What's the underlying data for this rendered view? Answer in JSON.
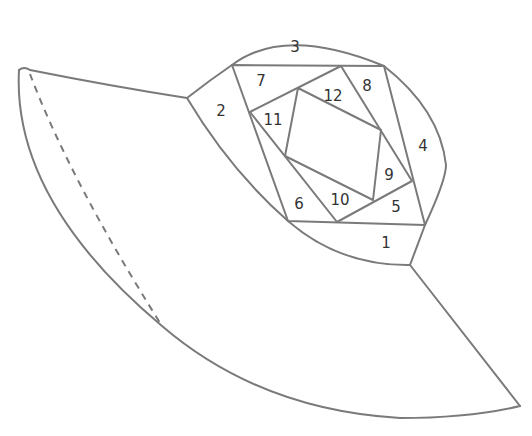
{
  "diagram": {
    "line_color": "#7a7a7a",
    "label_color": "#333333",
    "background": "#ffffff",
    "section_labels": [
      {
        "id": "1",
        "text": "1",
        "x": 386,
        "y": 243
      },
      {
        "id": "2",
        "text": "2",
        "x": 221,
        "y": 111
      },
      {
        "id": "3",
        "text": "3",
        "x": 295,
        "y": 47
      },
      {
        "id": "4",
        "text": "4",
        "x": 423,
        "y": 146
      },
      {
        "id": "5",
        "text": "5",
        "x": 396,
        "y": 207
      },
      {
        "id": "6",
        "text": "6",
        "x": 299,
        "y": 204
      },
      {
        "id": "7",
        "text": "7",
        "x": 261,
        "y": 81
      },
      {
        "id": "8",
        "text": "8",
        "x": 367,
        "y": 86
      },
      {
        "id": "9",
        "text": "9",
        "x": 389,
        "y": 175
      },
      {
        "id": "10",
        "text": "10",
        "x": 340,
        "y": 200
      },
      {
        "id": "11",
        "text": "11",
        "x": 273,
        "y": 120
      },
      {
        "id": "12",
        "text": "12",
        "x": 333,
        "y": 96
      }
    ],
    "brim": {
      "has_dashed_fold_line": true
    }
  }
}
